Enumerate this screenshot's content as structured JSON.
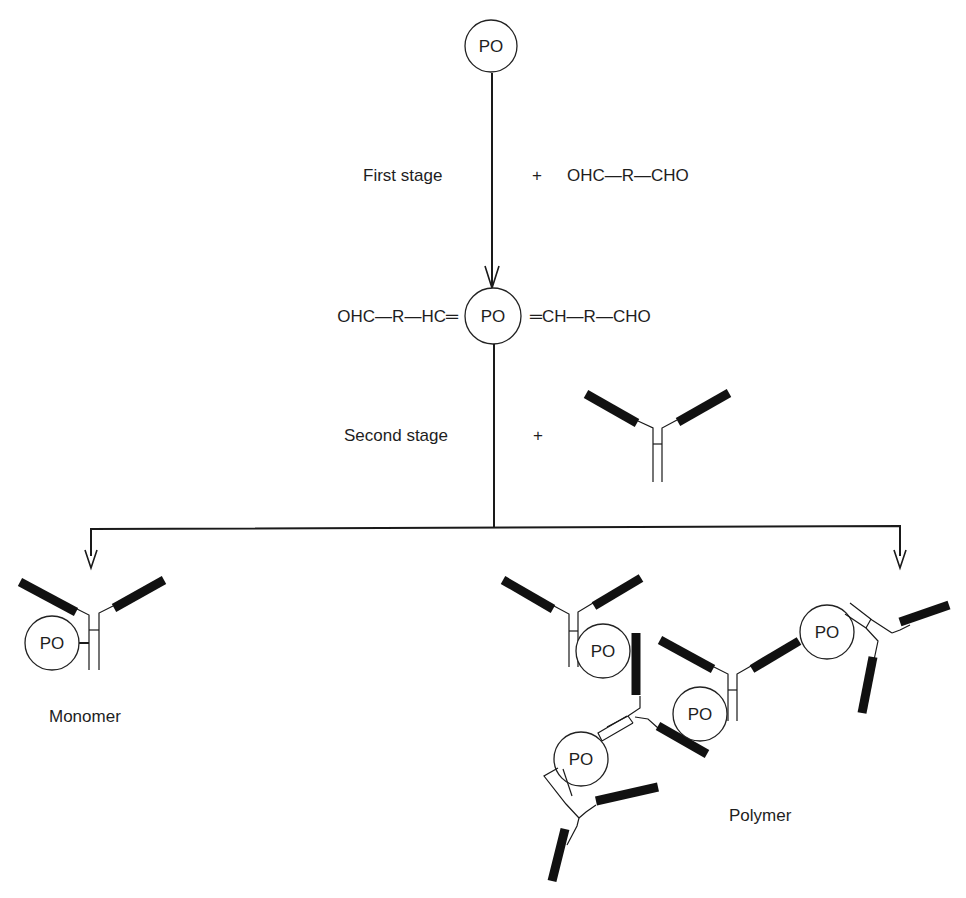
{
  "diagram": {
    "type": "reaction-scheme",
    "colors": {
      "ink": "#1a1a1a",
      "background": "#ffffff"
    },
    "top_node": {
      "label": "PO"
    },
    "first_stage": {
      "label": "First stage",
      "plus": "+",
      "reagent": "OHC—R—CHO"
    },
    "intermediate": {
      "left": "OHC—R—HC═",
      "center": "PO",
      "right": "═CH—R—CHO"
    },
    "second_stage": {
      "label": "Second stage",
      "plus": "+",
      "reagent_icon": "antibody-icon"
    },
    "products": {
      "monomer": {
        "label": "Monomer",
        "node": "PO"
      },
      "polymer": {
        "label": "Polymer",
        "nodes": [
          "PO",
          "PO",
          "PO",
          "PO"
        ]
      }
    }
  }
}
